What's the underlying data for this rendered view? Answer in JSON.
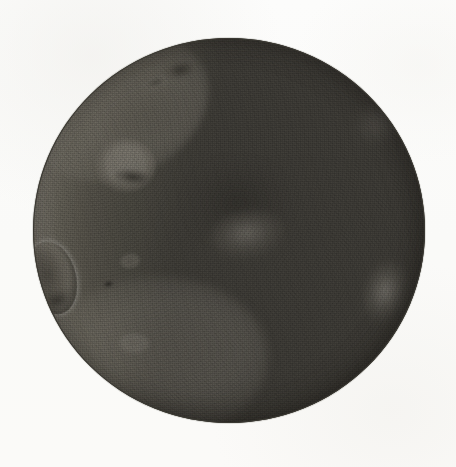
{
  "document": {
    "kind": "astronomical-drawing",
    "title": "Moon",
    "medium": "ink wash and pencil on paper",
    "background_color": "#fbfbfa",
    "caption": ""
  },
  "figure": {
    "name": "moon-disk",
    "phase": "waning gibbous / last quarter, illuminated limb on the left",
    "disk": {
      "center_x": 229,
      "center_y": 230,
      "radius": 196,
      "left": 33,
      "top": 38,
      "width": 392,
      "height": 385,
      "outline_color": "#3a3832"
    },
    "regions": [
      {
        "name": "illuminated-crescent",
        "side": "left",
        "color_light": "#f4f3ef",
        "color_mid": "#d2cec4"
      },
      {
        "name": "shadowed-hemisphere",
        "side": "right",
        "color": "#3a3833"
      },
      {
        "name": "terminator",
        "orientation": "near-vertical, slightly curved",
        "x_approx": 155
      }
    ],
    "features": [
      {
        "name": "crater-large-lower-left",
        "x": 52,
        "y": 278,
        "w": 48,
        "h": 74,
        "tone": "dark"
      },
      {
        "name": "crater-upper-left",
        "x": 125,
        "y": 166,
        "w": 62,
        "h": 56,
        "tone": "mid"
      },
      {
        "name": "crater-small-dot",
        "x": 108,
        "y": 284,
        "w": 13,
        "h": 10,
        "tone": "very-dark"
      },
      {
        "name": "crater-small-mid-left",
        "x": 130,
        "y": 261,
        "w": 22,
        "h": 16,
        "tone": "mid"
      },
      {
        "name": "crater-low-left",
        "x": 134,
        "y": 344,
        "w": 34,
        "h": 22,
        "tone": "faint"
      },
      {
        "name": "crater-top-limb",
        "x": 181,
        "y": 71,
        "w": 40,
        "h": 22,
        "tone": "dark"
      },
      {
        "name": "crater-top-limb-2",
        "x": 156,
        "y": 83,
        "w": 30,
        "h": 14,
        "tone": "mid"
      },
      {
        "name": "mare-light-patch-center",
        "x": 248,
        "y": 235,
        "w": 78,
        "h": 50,
        "tone": "light-in-shadow"
      },
      {
        "name": "limb-light-patch-right",
        "x": 386,
        "y": 293,
        "w": 46,
        "h": 66,
        "tone": "light-in-shadow"
      },
      {
        "name": "limb-wash-upper-left",
        "x": 118,
        "y": 108,
        "w": 188,
        "h": 138,
        "tone": "wash"
      }
    ],
    "palette": {
      "paper": "#fbfbfa",
      "lit_highlight": "#ffffff",
      "lit_base": "#eceae4",
      "lit_shade": "#bdb8ac",
      "shadow_dark": "#3a3833",
      "shadow_darkest": "#2a2825",
      "outline": "#3a3832"
    }
  }
}
